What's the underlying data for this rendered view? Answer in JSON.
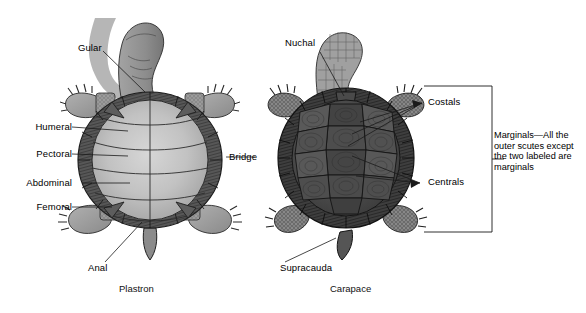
{
  "figure": {
    "background_color": "#ffffff",
    "line_color": "#1a1a1a",
    "width": 586,
    "height": 313
  },
  "plastron": {
    "caption": "Plastron",
    "labels": [
      {
        "name": "gular",
        "text": "Gular"
      },
      {
        "name": "humeral",
        "text": "Humeral"
      },
      {
        "name": "pectoral",
        "text": "Pectoral"
      },
      {
        "name": "abdominal",
        "text": "Abdominal"
      },
      {
        "name": "femoral",
        "text": "Femoral"
      },
      {
        "name": "anal",
        "text": "Anal"
      }
    ],
    "colors": {
      "shell_light": "#c9c9c9",
      "shell_mid": "#b3b3b3",
      "shell_dark": "#7d7d7d",
      "rim": "#4a4a4a",
      "limb": "#9a9a9a",
      "head": "#8f8f8f"
    }
  },
  "carapace": {
    "caption": "Carapace",
    "labels": [
      {
        "name": "nuchal",
        "text": "Nuchal"
      },
      {
        "name": "costals",
        "text": "Costals"
      },
      {
        "name": "centrals",
        "text": "Centrals"
      },
      {
        "name": "supracauda",
        "text": "Supracauda"
      }
    ],
    "colors": {
      "shell_dark": "#4f4f4f",
      "shell_mid": "#5e5e5e",
      "scute_dark": "#3a3a3a",
      "rim": "#2e2e2e",
      "limb": "#8a8a8a",
      "head": "#9b9b9b"
    }
  },
  "shared": {
    "bridge_label": "Bridge"
  },
  "marginals_note": {
    "text": "Marginals—All the outer scutes except the two labeled are marginals"
  },
  "bottom_partial_caption": {
    "text": ""
  }
}
